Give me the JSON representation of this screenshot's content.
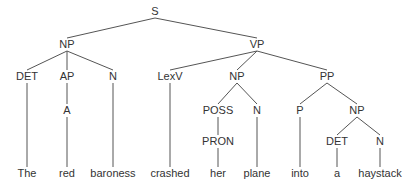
{
  "diagram": {
    "type": "syntax-tree",
    "colors": {
      "line": "#555555",
      "text": "#333333",
      "background": "#ffffff"
    },
    "nodes": [
      {
        "id": "s",
        "label": "S",
        "x": 155,
        "y": 15
      },
      {
        "id": "np1",
        "label": "NP",
        "x": 67,
        "y": 48
      },
      {
        "id": "vp",
        "label": "VP",
        "x": 257,
        "y": 48
      },
      {
        "id": "det1",
        "label": "DET",
        "x": 27,
        "y": 80
      },
      {
        "id": "ap",
        "label": "AP",
        "x": 67,
        "y": 80
      },
      {
        "id": "n1",
        "label": "N",
        "x": 113,
        "y": 80
      },
      {
        "id": "lexv",
        "label": "LexV",
        "x": 170,
        "y": 80
      },
      {
        "id": "np2",
        "label": "NP",
        "x": 237,
        "y": 80
      },
      {
        "id": "pp",
        "label": "PP",
        "x": 327,
        "y": 80
      },
      {
        "id": "a",
        "label": "A",
        "x": 67,
        "y": 114
      },
      {
        "id": "poss",
        "label": "POSS",
        "x": 218,
        "y": 114
      },
      {
        "id": "n2",
        "label": "N",
        "x": 257,
        "y": 114
      },
      {
        "id": "p",
        "label": "P",
        "x": 300,
        "y": 114
      },
      {
        "id": "np3",
        "label": "NP",
        "x": 357,
        "y": 114
      },
      {
        "id": "pron",
        "label": "PRON",
        "x": 218,
        "y": 145
      },
      {
        "id": "det2",
        "label": "DET",
        "x": 337,
        "y": 145
      },
      {
        "id": "n3",
        "label": "N",
        "x": 380,
        "y": 145
      },
      {
        "id": "w_the",
        "label": "The",
        "x": 27,
        "y": 177
      },
      {
        "id": "w_red",
        "label": "red",
        "x": 67,
        "y": 177
      },
      {
        "id": "w_baroness",
        "label": "baroness",
        "x": 113,
        "y": 177
      },
      {
        "id": "w_crashed",
        "label": "crashed",
        "x": 170,
        "y": 177
      },
      {
        "id": "w_her",
        "label": "her",
        "x": 218,
        "y": 177
      },
      {
        "id": "w_plane",
        "label": "plane",
        "x": 257,
        "y": 177
      },
      {
        "id": "w_into",
        "label": "into",
        "x": 300,
        "y": 177
      },
      {
        "id": "w_a",
        "label": "a",
        "x": 337,
        "y": 177
      },
      {
        "id": "w_haystack",
        "label": "haystack",
        "x": 380,
        "y": 177
      }
    ],
    "edges": [
      [
        "s",
        "np1"
      ],
      [
        "s",
        "vp"
      ],
      [
        "np1",
        "det1"
      ],
      [
        "np1",
        "ap"
      ],
      [
        "np1",
        "n1"
      ],
      [
        "vp",
        "lexv"
      ],
      [
        "vp",
        "np2"
      ],
      [
        "vp",
        "pp"
      ],
      [
        "ap",
        "a"
      ],
      [
        "np2",
        "poss"
      ],
      [
        "np2",
        "n2"
      ],
      [
        "pp",
        "p"
      ],
      [
        "pp",
        "np3"
      ],
      [
        "poss",
        "pron"
      ],
      [
        "np3",
        "det2"
      ],
      [
        "np3",
        "n3"
      ],
      [
        "det1",
        "w_the"
      ],
      [
        "a",
        "w_red"
      ],
      [
        "n1",
        "w_baroness"
      ],
      [
        "lexv",
        "w_crashed"
      ],
      [
        "pron",
        "w_her"
      ],
      [
        "n2",
        "w_plane"
      ],
      [
        "p",
        "w_into"
      ],
      [
        "det2",
        "w_a"
      ],
      [
        "n3",
        "w_haystack"
      ]
    ],
    "sentence": "The red baroness crashed her plane into a haystack"
  }
}
